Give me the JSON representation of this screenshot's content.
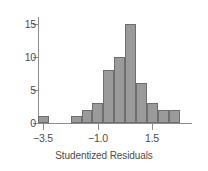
{
  "chart_data": {
    "type": "bar",
    "title": "",
    "xlabel": "Studentized Residuals",
    "ylabel": "",
    "xlim": [
      -3.75,
      3.0
    ],
    "ylim": [
      0,
      16
    ],
    "grid": false,
    "legend": null,
    "bin_width": 0.5,
    "xticks": [
      {
        "value": -3.5,
        "label": "−3.5"
      },
      {
        "value": -1.0,
        "label": "−1.0"
      },
      {
        "value": 1.5,
        "label": "1.5"
      }
    ],
    "yticks": [
      {
        "value": 0,
        "label": "0"
      },
      {
        "value": 5,
        "label": "5"
      },
      {
        "value": 10,
        "label": "10"
      },
      {
        "value": 15,
        "label": "15"
      }
    ],
    "bins": [
      {
        "x0": -3.75,
        "x1": -3.25,
        "center": -3.5,
        "count": 1
      },
      {
        "x0": -3.25,
        "x1": -2.75,
        "center": -3.0,
        "count": 0
      },
      {
        "x0": -2.75,
        "x1": -2.25,
        "center": -2.5,
        "count": 0
      },
      {
        "x0": -2.25,
        "x1": -1.75,
        "center": -2.0,
        "count": 1
      },
      {
        "x0": -1.75,
        "x1": -1.25,
        "center": -1.5,
        "count": 2
      },
      {
        "x0": -1.25,
        "x1": -0.75,
        "center": -1.0,
        "count": 3
      },
      {
        "x0": -0.75,
        "x1": -0.25,
        "center": -0.5,
        "count": 8
      },
      {
        "x0": -0.25,
        "x1": 0.25,
        "center": 0.0,
        "count": 10
      },
      {
        "x0": 0.25,
        "x1": 0.75,
        "center": 0.5,
        "count": 15
      },
      {
        "x0": 0.75,
        "x1": 1.25,
        "center": 1.0,
        "count": 6
      },
      {
        "x0": 1.25,
        "x1": 1.75,
        "center": 1.5,
        "count": 3
      },
      {
        "x0": 1.75,
        "x1": 2.25,
        "center": 2.0,
        "count": 2
      },
      {
        "x0": 2.25,
        "x1": 2.75,
        "center": 2.5,
        "count": 2
      }
    ],
    "colors": {
      "bar_fill": "#9a9a9a",
      "bar_stroke": "#6e6e6e",
      "axis": "#8d8d8d",
      "text": "#4d4d4d",
      "background": "#ffffff"
    }
  }
}
